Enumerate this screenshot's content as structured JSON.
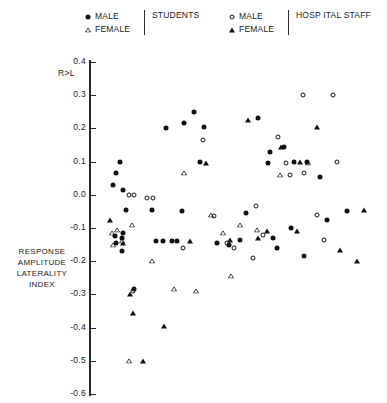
{
  "legend": {
    "students": {
      "category": "STUDENTS",
      "entries": [
        {
          "label": "MALE",
          "marker": "filled-circle"
        },
        {
          "label": "FEMALE",
          "marker": "open-triangle"
        }
      ]
    },
    "hospital_staff": {
      "category": "HOSP ITAL  STAFF",
      "entries": [
        {
          "label": "MALE",
          "marker": "open-circle"
        },
        {
          "label": "FEMALE",
          "marker": "filled-triangle"
        }
      ]
    }
  },
  "axis": {
    "y_title_lines": [
      "RESPONSE",
      "AMPLITUDE",
      "LATERALITY",
      "INDEX"
    ],
    "direction_note": "R>L",
    "y_ticks": [
      "0.4",
      "0.3",
      "0.2",
      "0.1",
      "0.0",
      "-0.1",
      "-0.2",
      "-0.3",
      "-0.4",
      "-0.5",
      "-0.6"
    ]
  },
  "chart_data": {
    "type": "scatter",
    "title": "",
    "xlabel": "",
    "ylabel": "RESPONSE AMPLITUDE LATERALITY INDEX",
    "ylim": [
      -0.6,
      0.4
    ],
    "yticks": [
      0.4,
      0.3,
      0.2,
      0.1,
      0.0,
      -0.1,
      -0.2,
      -0.3,
      -0.4,
      -0.5,
      -0.6
    ],
    "xlim": [
      0,
      100
    ],
    "xticks": [],
    "grid": false,
    "legend_position": "top",
    "annotations": [
      "R>L"
    ],
    "series": [
      {
        "name": "MALE STUDENTS",
        "marker": "filled-circle",
        "points": [
          {
            "x": 7.0,
            "y": 0.065
          },
          {
            "x": 6.0,
            "y": 0.03
          },
          {
            "x": 9.5,
            "y": 0.015
          },
          {
            "x": 8.5,
            "y": 0.1
          },
          {
            "x": 10.5,
            "y": -0.045
          },
          {
            "x": 6.5,
            "y": -0.125
          },
          {
            "x": 7.0,
            "y": -0.145
          },
          {
            "x": 9.0,
            "y": -0.13
          },
          {
            "x": 9.5,
            "y": -0.115
          },
          {
            "x": 9.0,
            "y": -0.17
          },
          {
            "x": 13.5,
            "y": -0.285
          },
          {
            "x": 19.5,
            "y": -0.045
          },
          {
            "x": 21.0,
            "y": -0.14
          },
          {
            "x": 23.5,
            "y": -0.14
          },
          {
            "x": 26.5,
            "y": -0.14
          },
          {
            "x": 28.5,
            "y": -0.14
          },
          {
            "x": 24.5,
            "y": 0.2
          },
          {
            "x": 31.0,
            "y": 0.215
          },
          {
            "x": 30.0,
            "y": -0.05
          },
          {
            "x": 36.5,
            "y": 0.1
          },
          {
            "x": 34.5,
            "y": 0.25
          },
          {
            "x": 38.0,
            "y": 0.205
          },
          {
            "x": 42.5,
            "y": -0.145
          },
          {
            "x": 46.5,
            "y": -0.15
          },
          {
            "x": 50.5,
            "y": -0.135
          },
          {
            "x": 52.5,
            "y": -0.055
          },
          {
            "x": 57.0,
            "y": 0.23
          },
          {
            "x": 60.5,
            "y": 0.095
          },
          {
            "x": 61.0,
            "y": 0.13
          },
          {
            "x": 62.0,
            "y": -0.13
          },
          {
            "x": 63.5,
            "y": -0.16
          },
          {
            "x": 66.0,
            "y": 0.145
          },
          {
            "x": 69.5,
            "y": 0.1
          },
          {
            "x": 68.5,
            "y": -0.1
          },
          {
            "x": 74.0,
            "y": 0.1
          },
          {
            "x": 73.0,
            "y": -0.185
          },
          {
            "x": 78.5,
            "y": 0.055
          },
          {
            "x": 81.0,
            "y": -0.075
          },
          {
            "x": 88.0,
            "y": -0.05
          }
        ]
      },
      {
        "name": "FEMALE STUDENTS",
        "marker": "open-triangle",
        "points": [
          {
            "x": 5.5,
            "y": -0.115
          },
          {
            "x": 7.5,
            "y": -0.105
          },
          {
            "x": 6.0,
            "y": -0.15
          },
          {
            "x": 9.0,
            "y": -0.14
          },
          {
            "x": 12.5,
            "y": -0.09
          },
          {
            "x": 19.5,
            "y": -0.2
          },
          {
            "x": 27.5,
            "y": -0.285
          },
          {
            "x": 31.0,
            "y": 0.065
          },
          {
            "x": 35.0,
            "y": -0.29
          },
          {
            "x": 40.5,
            "y": -0.06
          },
          {
            "x": 44.5,
            "y": -0.115
          },
          {
            "x": 47.5,
            "y": -0.245
          },
          {
            "x": 56.5,
            "y": -0.105
          },
          {
            "x": 64.5,
            "y": 0.06
          },
          {
            "x": 74.5,
            "y": 0.095
          },
          {
            "x": 11.5,
            "y": -0.5
          },
          {
            "x": 50.5,
            "y": -0.09
          }
        ]
      },
      {
        "name": "MALE HOSPITAL STAFF",
        "marker": "open-circle",
        "points": [
          {
            "x": 11.5,
            "y": 0.0
          },
          {
            "x": 13.5,
            "y": 0.0
          },
          {
            "x": 18.0,
            "y": -0.01
          },
          {
            "x": 20.0,
            "y": -0.01
          },
          {
            "x": 13.0,
            "y": -0.29
          },
          {
            "x": 30.5,
            "y": -0.16
          },
          {
            "x": 37.5,
            "y": 0.165
          },
          {
            "x": 41.5,
            "y": -0.065
          },
          {
            "x": 46.0,
            "y": -0.145
          },
          {
            "x": 48.5,
            "y": -0.16
          },
          {
            "x": 56.0,
            "y": -0.035
          },
          {
            "x": 58.5,
            "y": -0.12
          },
          {
            "x": 64.0,
            "y": 0.175
          },
          {
            "x": 66.5,
            "y": 0.095
          },
          {
            "x": 68.0,
            "y": 0.06
          },
          {
            "x": 72.5,
            "y": 0.3
          },
          {
            "x": 73.0,
            "y": 0.065
          },
          {
            "x": 77.5,
            "y": -0.06
          },
          {
            "x": 83.0,
            "y": 0.3
          },
          {
            "x": 84.5,
            "y": 0.1
          },
          {
            "x": 80.0,
            "y": -0.135
          },
          {
            "x": 55.0,
            "y": -0.19
          }
        ]
      },
      {
        "name": "FEMALE HOSPITAL STAFF",
        "marker": "filled-triangle",
        "points": [
          {
            "x": 5.0,
            "y": -0.075
          },
          {
            "x": 9.5,
            "y": -0.145
          },
          {
            "x": 12.0,
            "y": -0.3
          },
          {
            "x": 13.0,
            "y": -0.355
          },
          {
            "x": 16.5,
            "y": -0.5
          },
          {
            "x": 24.0,
            "y": -0.395
          },
          {
            "x": 33.0,
            "y": -0.14
          },
          {
            "x": 38.5,
            "y": 0.095
          },
          {
            "x": 47.0,
            "y": -0.135
          },
          {
            "x": 53.5,
            "y": 0.225
          },
          {
            "x": 57.0,
            "y": -0.13
          },
          {
            "x": 60.0,
            "y": -0.11
          },
          {
            "x": 65.0,
            "y": 0.145
          },
          {
            "x": 70.5,
            "y": -0.11
          },
          {
            "x": 71.5,
            "y": 0.1
          },
          {
            "x": 77.5,
            "y": 0.205
          },
          {
            "x": 85.5,
            "y": -0.165
          },
          {
            "x": 91.5,
            "y": -0.2
          },
          {
            "x": 94.0,
            "y": -0.045
          }
        ]
      }
    ]
  }
}
